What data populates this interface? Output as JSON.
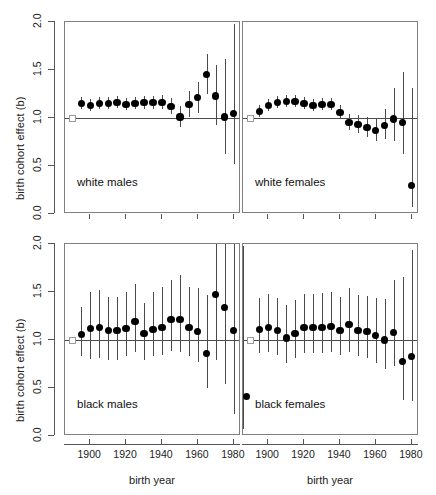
{
  "figure": {
    "ylabel": "birth cohort effect (b)",
    "xlabel": "birth year",
    "yticks": [
      "0.0",
      "0.5",
      "1.0",
      "1.5",
      "2.0"
    ],
    "ytick_values": [
      0.0,
      0.5,
      1.0,
      1.5,
      2.0
    ],
    "xticks": [
      "1900",
      "1920",
      "1940",
      "1960",
      "1980"
    ],
    "xtick_values": [
      1900,
      1920,
      1940,
      1960,
      1980
    ],
    "reference_value": 1.0,
    "colors": {
      "point": "#000000",
      "interval": "#4a4a4a",
      "reference_line": "#4a4a4a",
      "reference_square": "#9a9a9a",
      "panel_border": "#808080",
      "background": "#ffffff"
    }
  },
  "chart_data": {
    "type": "scatter",
    "title": "",
    "xlabel": "birth year",
    "ylabel": "birth cohort effect (b)",
    "xlim": [
      1886,
      1984
    ],
    "ylim": [
      0.0,
      2.0
    ],
    "grid": false,
    "legend": "none",
    "layout": "2x2 panel grid",
    "annotations": [
      "white males",
      "white females",
      "black males",
      "black females"
    ],
    "reference_line_y": 1.0,
    "panels": [
      {
        "name": "white males",
        "row": 0,
        "col": 0,
        "reference_point": {
          "x": 1890,
          "y": 1.0
        },
        "x": [
          1895,
          1900,
          1905,
          1910,
          1915,
          1920,
          1925,
          1930,
          1935,
          1940,
          1945,
          1950,
          1955,
          1960,
          1965,
          1970,
          1975,
          1980
        ],
        "y": [
          1.15,
          1.13,
          1.15,
          1.15,
          1.16,
          1.14,
          1.15,
          1.16,
          1.16,
          1.16,
          1.12,
          1.01,
          1.14,
          1.21,
          1.45,
          1.23,
          1.01,
          1.05
        ],
        "lo": [
          1.09,
          1.07,
          1.09,
          1.09,
          1.1,
          1.08,
          1.09,
          1.09,
          1.09,
          1.09,
          1.04,
          0.91,
          1.01,
          1.05,
          1.25,
          0.93,
          0.62,
          0.52
        ],
        "hi": [
          1.22,
          1.2,
          1.22,
          1.22,
          1.23,
          1.21,
          1.22,
          1.23,
          1.23,
          1.24,
          1.21,
          1.12,
          1.28,
          1.38,
          1.67,
          1.55,
          1.61,
          1.98
        ]
      },
      {
        "name": "white females",
        "row": 0,
        "col": 1,
        "reference_point": {
          "x": 1890,
          "y": 1.0
        },
        "x": [
          1895,
          1900,
          1905,
          1910,
          1915,
          1920,
          1925,
          1930,
          1935,
          1940,
          1945,
          1950,
          1955,
          1960,
          1965,
          1970,
          1975,
          1980
        ],
        "y": [
          1.07,
          1.13,
          1.16,
          1.17,
          1.17,
          1.15,
          1.13,
          1.14,
          1.14,
          1.06,
          0.95,
          0.93,
          0.9,
          0.87,
          0.92,
          0.99,
          0.95,
          0.3
        ],
        "lo": [
          1.01,
          1.07,
          1.1,
          1.11,
          1.11,
          1.09,
          1.07,
          1.08,
          1.08,
          0.99,
          0.87,
          0.84,
          0.8,
          0.76,
          0.78,
          0.76,
          0.62,
          0.07
        ],
        "hi": [
          1.14,
          1.2,
          1.23,
          1.24,
          1.24,
          1.22,
          1.2,
          1.21,
          1.21,
          1.14,
          1.04,
          1.03,
          1.01,
          1.0,
          1.09,
          1.31,
          1.48,
          1.31
        ]
      },
      {
        "name": "black males",
        "row": 1,
        "col": 0,
        "reference_point": {
          "x": 1890,
          "y": 1.0
        },
        "x": [
          1895,
          1900,
          1905,
          1910,
          1915,
          1920,
          1925,
          1930,
          1935,
          1940,
          1945,
          1950,
          1955,
          1960,
          1965,
          1970,
          1975,
          1980
        ],
        "y": [
          1.06,
          1.12,
          1.13,
          1.1,
          1.1,
          1.12,
          1.19,
          1.07,
          1.11,
          1.13,
          1.21,
          1.21,
          1.13,
          1.09,
          0.86,
          1.47,
          1.34,
          1.1
        ],
        "lo": [
          0.83,
          0.8,
          0.81,
          0.79,
          0.79,
          0.83,
          0.88,
          0.79,
          0.83,
          0.84,
          0.89,
          0.88,
          0.83,
          0.77,
          0.5,
          0.79,
          0.54,
          0.23
        ],
        "hi": [
          1.34,
          1.5,
          1.52,
          1.45,
          1.45,
          1.5,
          1.58,
          1.39,
          1.5,
          1.55,
          1.62,
          1.68,
          1.55,
          1.54,
          1.47,
          2.0,
          2.0,
          2.0
        ]
      },
      {
        "name": "black females",
        "row": 1,
        "col": 1,
        "reference_point": {
          "x": 1890,
          "y": 1.0
        },
        "x": [
          1895,
          1900,
          1905,
          1910,
          1915,
          1920,
          1925,
          1930,
          1935,
          1940,
          1945,
          1950,
          1955,
          1960,
          1965,
          1970,
          1975,
          1980
        ],
        "y": [
          1.11,
          1.13,
          1.1,
          1.02,
          1.07,
          1.13,
          1.13,
          1.13,
          1.14,
          1.1,
          1.16,
          1.1,
          1.09,
          1.05,
          1.0,
          1.08,
          0.78,
          0.83,
          0.41
        ],
        "lo": [
          0.86,
          0.87,
          0.84,
          0.76,
          0.81,
          0.86,
          0.86,
          0.86,
          0.87,
          0.84,
          0.88,
          0.83,
          0.81,
          0.76,
          0.7,
          0.73,
          0.37,
          0.36,
          0.07
        ],
        "hi": [
          1.44,
          1.48,
          1.44,
          1.36,
          1.42,
          1.48,
          1.48,
          1.49,
          1.5,
          1.45,
          1.54,
          1.47,
          1.46,
          1.44,
          1.43,
          1.62,
          1.66,
          1.94,
          1.98
        ]
      }
    ]
  }
}
